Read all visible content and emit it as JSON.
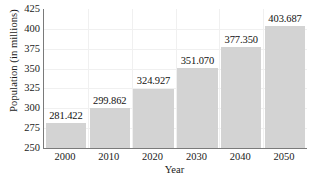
{
  "chart_data": {
    "type": "bar",
    "title": "",
    "xlabel": "Year",
    "ylabel": "Population (in millions)",
    "categories": [
      "2000",
      "2010",
      "2020",
      "2030",
      "2040",
      "2050"
    ],
    "values": [
      281.422,
      299.862,
      324.927,
      351.07,
      377.35,
      403.687
    ],
    "value_labels": [
      "281.422",
      "299.862",
      "324.927",
      "351.070",
      "377.350",
      "403.687"
    ],
    "ylim": [
      250,
      425
    ],
    "yticks": [
      250,
      275,
      300,
      325,
      350,
      375,
      400,
      425
    ],
    "ytick_labels": [
      "250",
      "275",
      "300",
      "325",
      "350",
      "375",
      "400",
      "425"
    ],
    "grid": true,
    "legend": false,
    "bar_color": "#d3d3d3",
    "axis_color": "#7a7a7a",
    "grid_color": "#f0f0f0",
    "text_color": "#1a1a1a"
  }
}
